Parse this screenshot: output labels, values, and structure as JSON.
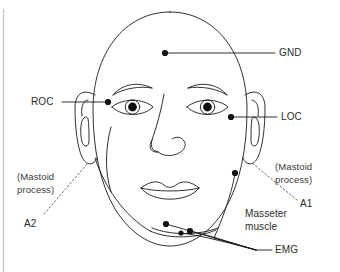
{
  "figure": {
    "stroke_color": "#1a1a1a",
    "text_color": "#2b2b2b",
    "rule_color": "#c9c9c9",
    "background": "#ffffff"
  },
  "labels": {
    "gnd": "GND",
    "roc": "ROC",
    "loc": "LOC",
    "a1": "A1",
    "a2": "A2",
    "emg": "EMG",
    "mastoid_left_line1": "(Mastoid",
    "mastoid_left_line2": "process)",
    "mastoid_right_line1": "(Mastoid",
    "mastoid_right_line2": "process)",
    "masseter_line1": "Masseter",
    "masseter_line2": "muscle"
  },
  "electrodes": [
    {
      "name": "GND",
      "x": 165,
      "y": 53,
      "label_x": 279,
      "label_y": 48
    },
    {
      "name": "ROC",
      "x": 108,
      "y": 102,
      "label_x": 32,
      "label_y": 97
    },
    {
      "name": "LOC",
      "x": 231,
      "y": 117,
      "label_x": 281,
      "label_y": 112
    },
    {
      "name": "EMG-chin",
      "x": 166,
      "y": 224
    },
    {
      "name": "EMG-jaw-left",
      "x": 181,
      "y": 233
    },
    {
      "name": "EMG-jaw-right",
      "x": 190,
      "y": 231
    },
    {
      "name": "Masseter",
      "x": 235,
      "y": 173
    }
  ],
  "annotations": [
    {
      "name": "A1",
      "kind": "dotted-leader",
      "target": "right mastoid process"
    },
    {
      "name": "A2",
      "kind": "dotted-leader",
      "target": "left mastoid process"
    }
  ]
}
